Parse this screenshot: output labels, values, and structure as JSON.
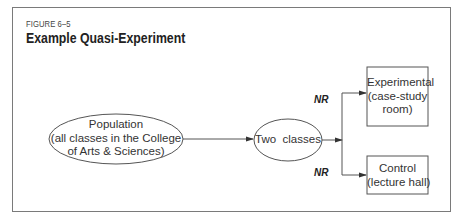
{
  "figure": {
    "label": "FIGURE 6–5",
    "title": "Example Quasi-Experiment"
  },
  "nodes": {
    "population": {
      "line1": "Population",
      "line2": "(all classes in the College",
      "line3": "of Arts & Sciences)"
    },
    "two_classes": {
      "label": "Two  classes"
    },
    "experimental": {
      "line1": "Experimental",
      "line2": "(case-study",
      "line3": "room)"
    },
    "control": {
      "line1": "Control",
      "line2": "(lecture hall)"
    }
  },
  "edge_labels": {
    "upper": "NR",
    "lower": "NR"
  },
  "colors": {
    "stroke": "#555555",
    "frame": "#7a7a7a",
    "text": "#2a2a2a"
  }
}
